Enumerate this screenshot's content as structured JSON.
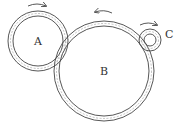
{
  "diagram": {
    "type": "gear-train",
    "gears": [
      {
        "label": "A",
        "cx": 38,
        "cy": 41,
        "r_outer": 30,
        "r_inner": 25,
        "rotation": "clockwise"
      },
      {
        "label": "B",
        "cx": 104,
        "cy": 71,
        "r_outer": 50,
        "r_inner": 45,
        "rotation": "counterclockwise"
      },
      {
        "label": "C",
        "cx": 150,
        "cy": 40,
        "r_outer": 11,
        "r_inner": 6,
        "rotation": "clockwise"
      }
    ],
    "colors": {
      "stroke": "#444444",
      "dash": "#888888",
      "background": "#ffffff"
    }
  }
}
